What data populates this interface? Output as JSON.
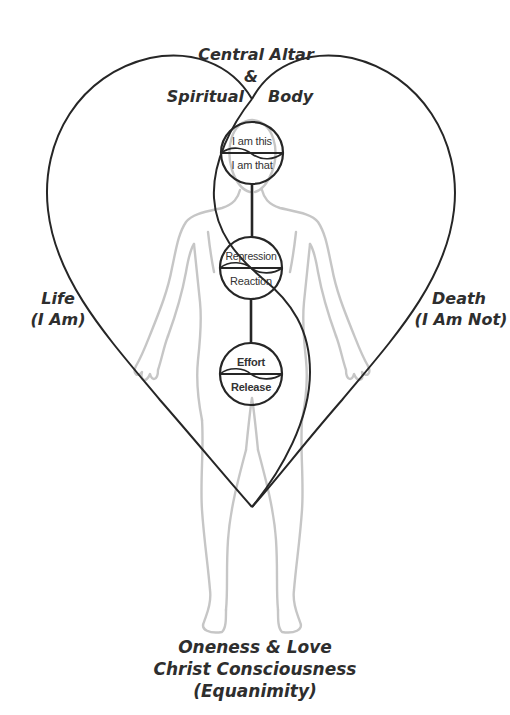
{
  "diagram": {
    "title_top": {
      "line1": "Central Altar",
      "line2": "&",
      "left": "Spiritual",
      "right": "Body"
    },
    "left_label": {
      "line1": "Life",
      "line2": "(I Am)"
    },
    "right_label": {
      "line1": "Death",
      "line2": "(I Am Not)"
    },
    "bottom_label": {
      "line1": "Oneness & Love",
      "line2": "Christ Consciousness",
      "line3": "(Equanimity)"
    },
    "circles": [
      {
        "name": "head",
        "top": "I am this",
        "bottom": "I am that"
      },
      {
        "name": "heart",
        "top": "Repression",
        "bottom": "Reaction"
      },
      {
        "name": "belly",
        "top": "Effort",
        "bottom": "Release"
      }
    ],
    "colors": {
      "line": "#262626",
      "figure": "#c4c4c4",
      "text": "#2e2e2e",
      "background": "#ffffff"
    }
  }
}
